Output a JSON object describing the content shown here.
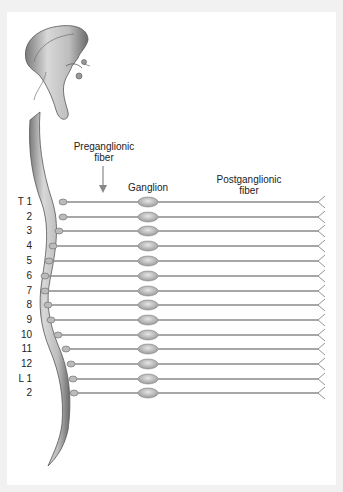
{
  "diagram": {
    "labels": {
      "preganglionic_line1": "Preganglionic",
      "preganglionic_line2": "fiber",
      "ganglion": "Ganglion",
      "postganglionic_line1": "Postganglionic",
      "postganglionic_line2": "fiber"
    },
    "segments": [
      "T 1",
      "2",
      "3",
      "4",
      "5",
      "6",
      "7",
      "8",
      "9",
      "10",
      "11",
      "12",
      "L 1",
      "2"
    ],
    "colors": {
      "background": "#f1f1f1",
      "panel": "#ffffff",
      "fiber": "#8a8a8a",
      "spinal_cord": "#b5b5b5",
      "ganglion": "#c8c8c8",
      "text": "#222222"
    }
  }
}
